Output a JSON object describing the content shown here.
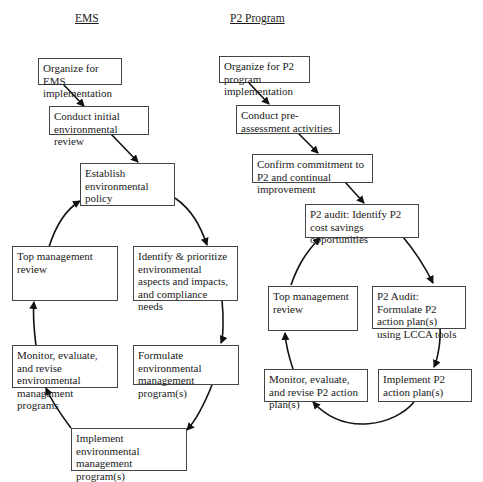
{
  "ems": {
    "heading": "EMS",
    "steps": [
      {
        "id": "organize",
        "text": "Organize for EMS implementation"
      },
      {
        "id": "initial-review",
        "text": "Conduct initial environmental review"
      },
      {
        "id": "policy",
        "text": "Establish environmental policy"
      },
      {
        "id": "aspects",
        "text": "Identify & prioritize environmental aspects and impacts, and compliance needs"
      },
      {
        "id": "formulate",
        "text": "Formulate environmental management program(s)"
      },
      {
        "id": "implement",
        "text": "Implement environmental management program(s)"
      },
      {
        "id": "monitor",
        "text": "Monitor, evaluate, and revise environmental management programs"
      },
      {
        "id": "top-review",
        "text": "Top management review"
      }
    ]
  },
  "p2": {
    "heading": "P2 Program",
    "steps": [
      {
        "id": "organize",
        "text": "Organize for P2 program implementation"
      },
      {
        "id": "pre-assessment",
        "text": "Conduct pre-assessment activities"
      },
      {
        "id": "commitment",
        "text": "Confirm commitment to P2 and continual improvement"
      },
      {
        "id": "audit-identify",
        "text": "P2 audit: Identify P2 cost savings opportunities"
      },
      {
        "id": "audit-formulate",
        "text": "P2 Audit: Formulate P2 action plan(s) using LCCA tools"
      },
      {
        "id": "implement",
        "text": "Implement P2 action plan(s)"
      },
      {
        "id": "monitor",
        "text": "Monitor, evaluate, and revise P2 action plan(s)"
      },
      {
        "id": "top-review",
        "text": "Top management review"
      }
    ]
  }
}
